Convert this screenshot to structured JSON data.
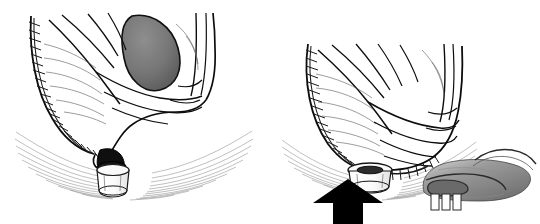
{
  "figure": {
    "panel_count": 2,
    "background_color": "#ffffff",
    "ink_color": "#0d0d0d",
    "shading_color": "#7a7a7a",
    "arrow_color": "#000000"
  },
  "panels": [
    {
      "id": "panel-left",
      "name": "left-panel",
      "caption": "",
      "description": "Sagittal view of pelvis showing sutured colonic pouch descending to the anal canal with stapler anvil seated at the anus",
      "elements": [
        {
          "name": "colon-wall-outline",
          "type": "outline"
        },
        {
          "name": "mucosal-folds",
          "type": "folds",
          "count": 14
        },
        {
          "name": "suture-line",
          "type": "stitches",
          "side": "left",
          "stitch_count": 22
        },
        {
          "name": "lumen-shadow",
          "type": "shaded-ellipse",
          "color": "#6f6f6f"
        },
        {
          "name": "anal-sphincter-fibers",
          "type": "concentric-arcs",
          "count": 11
        },
        {
          "name": "stapler-anvil",
          "type": "device",
          "color": "#ffffff"
        },
        {
          "name": "anal-opening",
          "type": "dark-aperture",
          "color": "#111111"
        }
      ]
    },
    {
      "id": "panel-right",
      "name": "right-panel",
      "caption": "",
      "description": "Stapler anvil advanced upward through the anus into the pouch, with inset detail of the anvil engaging the bowel",
      "elements": [
        {
          "name": "colon-wall-outline",
          "type": "outline"
        },
        {
          "name": "mucosal-folds",
          "type": "folds",
          "count": 14
        },
        {
          "name": "suture-line",
          "type": "stitches",
          "side": "left",
          "stitch_count": 20
        },
        {
          "name": "transverse-staple-line",
          "type": "stitches",
          "stitch_count": 12
        },
        {
          "name": "anal-sphincter-fibers",
          "type": "concentric-arcs",
          "count": 11
        },
        {
          "name": "stapler-anvil",
          "type": "device",
          "color": "#ffffff"
        },
        {
          "name": "direction-arrow",
          "type": "arrow",
          "direction": "up",
          "color": "#000000"
        },
        {
          "name": "inset-bowel-loop",
          "type": "shaded-organ",
          "color": "#8a8a8a"
        },
        {
          "name": "inset-anvil",
          "type": "device",
          "color": "#ffffff"
        }
      ]
    }
  ],
  "annotations": {
    "arrow_label": "",
    "inset_label": "",
    "text_labels": []
  }
}
